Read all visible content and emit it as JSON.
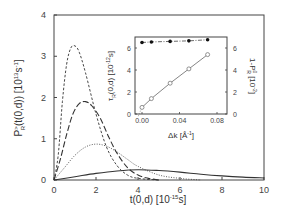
{
  "chart_data": [
    {
      "type": "line",
      "title": "",
      "xlabel": "t(0,d) [10^-15 s]",
      "ylabel": "P_R^>(t(0,d)) [10^13 s^-1]",
      "xlim": [
        0,
        10
      ],
      "ylim": [
        0,
        4
      ],
      "x_ticks": [
        "0",
        "2",
        "4",
        "6",
        "8",
        "10"
      ],
      "y_ticks": [
        "0",
        "1",
        "2",
        "3",
        "4"
      ],
      "grid": false,
      "legend": null,
      "series": [
        {
          "name": "short-dashed",
          "style": "short-dash",
          "x": [
            0,
            0.2,
            0.4,
            0.6,
            0.8,
            1.0,
            1.2,
            1.5,
            2.0,
            2.5,
            3.0,
            3.5,
            4.0,
            5.0
          ],
          "y": [
            0,
            0.6,
            1.9,
            2.8,
            3.2,
            3.25,
            3.1,
            2.6,
            1.6,
            0.8,
            0.35,
            0.12,
            0.04,
            0.0
          ]
        },
        {
          "name": "long-dashed",
          "style": "long-dash",
          "x": [
            0,
            0.3,
            0.6,
            0.9,
            1.2,
            1.5,
            1.8,
            2.2,
            2.6,
            3.0,
            3.5,
            4.0,
            4.5,
            5.0
          ],
          "y": [
            0,
            0.5,
            1.1,
            1.6,
            1.85,
            1.9,
            1.8,
            1.5,
            1.05,
            0.65,
            0.3,
            0.12,
            0.04,
            0.0
          ]
        },
        {
          "name": "dotted",
          "style": "dotted",
          "x": [
            0,
            0.5,
            1.0,
            1.5,
            2.0,
            2.5,
            3.0,
            3.5,
            4.0,
            5.0,
            6.0,
            7.0
          ],
          "y": [
            0,
            0.3,
            0.6,
            0.8,
            0.87,
            0.82,
            0.68,
            0.5,
            0.33,
            0.12,
            0.04,
            0.0
          ]
        },
        {
          "name": "solid",
          "style": "solid",
          "x": [
            0,
            1,
            2,
            3,
            4,
            5,
            6,
            7,
            8,
            9,
            10
          ],
          "y": [
            0,
            0.08,
            0.16,
            0.22,
            0.25,
            0.23,
            0.19,
            0.14,
            0.1,
            0.07,
            0.05
          ]
        }
      ],
      "annotations": []
    },
    {
      "type": "scatter",
      "title": "inset",
      "xlabel": "Δk [Å^-1]",
      "ylabel": "τ_R(0,d) [10^-12 s]",
      "ylabel_right": "1-P_R^0 [10^-2]",
      "xlim": [
        0,
        0.09
      ],
      "ylim": [
        0,
        7
      ],
      "x_ticks": [
        "0.00",
        "0.04",
        "0.08"
      ],
      "y_ticks": [
        "0",
        "2",
        "4",
        "6"
      ],
      "y_ticks_right": [
        "0",
        "2",
        "4",
        "6"
      ],
      "series": [
        {
          "name": "tau_R (filled circles)",
          "marker": "filled-circle",
          "line": "dash-dot",
          "x": [
            0.0,
            0.01,
            0.03,
            0.05,
            0.07
          ],
          "y": [
            6.5,
            6.55,
            6.6,
            6.65,
            6.75
          ]
        },
        {
          "name": "1-P_R^0 (open circles)",
          "marker": "open-circle",
          "line": "solid",
          "x": [
            0.0,
            0.01,
            0.03,
            0.05,
            0.07
          ],
          "y": [
            0.6,
            1.4,
            2.8,
            4.1,
            5.4
          ]
        }
      ]
    }
  ],
  "labels": {
    "xlabel_main": "t(0,d) [10",
    "xlabel_exp": "-15",
    "xlabel_tail": "s]",
    "ylabel_main_pre": "P",
    "ylabel_main_sup": ">",
    "ylabel_main_sub": "R",
    "ylabel_main_rest": "(t(0,d)) [10",
    "ylabel_main_exp": "13",
    "ylabel_main_s": "s",
    "ylabel_main_exp2": "-1",
    "ylabel_main_end": "]",
    "inset_xlabel": "Δk [Å",
    "inset_xlabel_exp": "-1",
    "inset_xlabel_end": "]",
    "inset_ylabel_pre": "τ",
    "inset_ylabel_sub": "R",
    "inset_ylabel_rest": "(0,d) [10",
    "inset_ylabel_exp": "-12",
    "inset_ylabel_end": "s]",
    "inset_yrlabel_pre": "1-P",
    "inset_yrlabel_sup": "0",
    "inset_yrlabel_sub": "R",
    "inset_yrlabel_rest": " [10",
    "inset_yrlabel_exp": "-2",
    "inset_yrlabel_end": "]"
  }
}
